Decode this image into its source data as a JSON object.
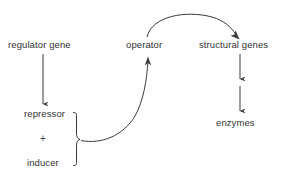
{
  "diagram": {
    "background_color": "#fefefe",
    "stroke_color": "#3a3a3a",
    "text_color": "#333333",
    "nodes": [
      {
        "id": "regulator_gene",
        "label": "regulator gene"
      },
      {
        "id": "repressor",
        "label": "repressor"
      },
      {
        "id": "plus",
        "label": "+"
      },
      {
        "id": "inducer",
        "label": "inducer"
      },
      {
        "id": "operator",
        "label": "operator"
      },
      {
        "id": "structural_genes",
        "label": "structural genes"
      },
      {
        "id": "enzymes",
        "label": "enzymes"
      }
    ],
    "connectors": [
      {
        "id": "regulator-to-repressor",
        "kind": "straight-arrow-down"
      },
      {
        "id": "repressor-inducer-brace",
        "kind": "curly-brace"
      },
      {
        "id": "complex-to-operator",
        "kind": "curved-arrow-up"
      },
      {
        "id": "operator-to-structural",
        "kind": "curved-arrow-arc"
      },
      {
        "id": "structural-to-mid",
        "kind": "straight-arrow-down"
      },
      {
        "id": "mid-to-enzymes",
        "kind": "straight-arrow-down"
      }
    ]
  }
}
